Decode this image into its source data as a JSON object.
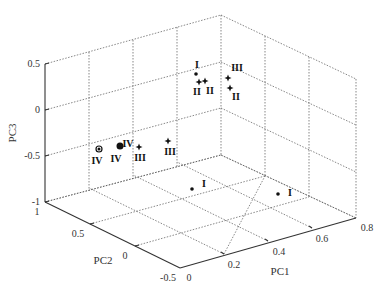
{
  "chart_data": {
    "type": "scatter3d",
    "title": "",
    "axes": {
      "x": {
        "label": "PC1",
        "ticks": [
          "0",
          "0.2",
          "0.4",
          "0.6",
          "0.8"
        ],
        "range": [
          0,
          0.8
        ]
      },
      "y": {
        "label": "PC2",
        "ticks": [
          "-0.5",
          "0",
          "0.5",
          "1"
        ],
        "range": [
          -0.5,
          1
        ]
      },
      "z": {
        "label": "PC3",
        "ticks": [
          "-1",
          "-0.5",
          "0",
          "0.5"
        ],
        "range": [
          -1,
          0.5
        ]
      }
    },
    "grid": true,
    "legend": null,
    "points": [
      {
        "label": "IV",
        "marker": "ring",
        "px": 99,
        "py": 149,
        "lx": 97,
        "ly": 164
      },
      {
        "label": "IV",
        "marker": "bigdot",
        "px": 120,
        "py": 146,
        "lx": 116,
        "ly": 162
      },
      {
        "label": "IV",
        "marker": "none",
        "px": 0,
        "py": 0,
        "lx": 128,
        "ly": 147
      },
      {
        "label": "III",
        "marker": "star",
        "px": 139,
        "py": 147,
        "lx": 140,
        "ly": 161
      },
      {
        "label": "III",
        "marker": "star",
        "px": 168,
        "py": 141,
        "lx": 170,
        "ly": 155
      },
      {
        "label": "I",
        "marker": "dot",
        "px": 196,
        "py": 74,
        "lx": 197,
        "ly": 68
      },
      {
        "label": "II",
        "marker": "star",
        "px": 199,
        "py": 82,
        "lx": 197,
        "ly": 95
      },
      {
        "label": "II",
        "marker": "star",
        "px": 205,
        "py": 81,
        "lx": 210,
        "ly": 94
      },
      {
        "label": "III",
        "marker": "star",
        "px": 228,
        "py": 78,
        "lx": 237,
        "ly": 71
      },
      {
        "label": "II",
        "marker": "star",
        "px": 230,
        "py": 88,
        "lx": 236,
        "ly": 100
      },
      {
        "label": "I",
        "marker": "dot",
        "px": 192,
        "py": 189,
        "lx": 204,
        "ly": 187
      },
      {
        "label": "I",
        "marker": "dot",
        "px": 278,
        "py": 194,
        "lx": 290,
        "ly": 196
      }
    ]
  }
}
